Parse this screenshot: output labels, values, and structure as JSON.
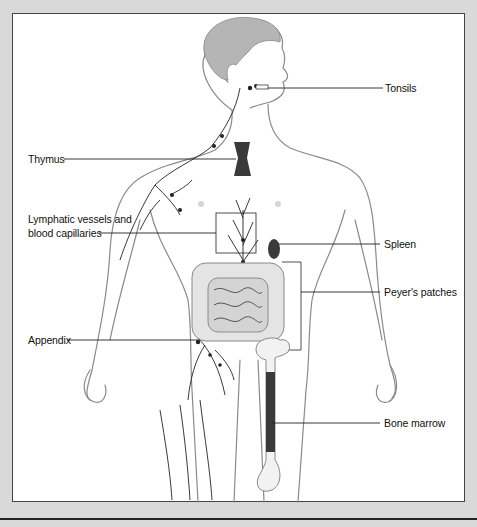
{
  "figure": {
    "labels": {
      "tonsils": "Tonsils",
      "thymus": "Thymus",
      "lymphatic_line1": "Lymphatic vessels and",
      "lymphatic_line2": "blood capillaries",
      "spleen": "Spleen",
      "peyers": "Peyer's patches",
      "appendix": "Appendix",
      "bone_marrow": "Bone marrow"
    },
    "colors": {
      "background": "#d9d9d9",
      "panel": "#ffffff",
      "ink": "#111111",
      "organ": "#3a3a3a",
      "skin_line": "#8a8a8a"
    }
  }
}
